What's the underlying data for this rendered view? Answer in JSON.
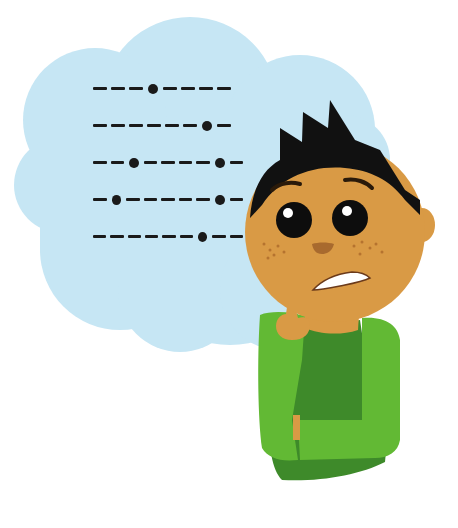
{
  "scene": {
    "description": "Cartoon boy with worried expression thinking of morse code sequences in a thought cloud",
    "colors": {
      "cloud": "#c6e6f4",
      "skin": "#d99a45",
      "hair": "#111111",
      "sweater_light": "#62b934",
      "sweater_dark": "#3e8a2a",
      "morse": "#1a1a1a"
    }
  },
  "thought_cloud": {
    "morse_rows": [
      [
        "dash",
        "dash",
        "dash",
        "dot",
        "dash",
        "dash",
        "dash",
        "dash"
      ],
      [
        "dash",
        "dash",
        "dash",
        "dash",
        "dash",
        "dash",
        "dot",
        "dash"
      ],
      [
        "dash",
        "dash",
        "dot",
        "dash",
        "dash",
        "dash",
        "dash",
        "dot",
        "dash"
      ],
      [
        "dash",
        "dot",
        "dash",
        "dash",
        "dash",
        "dash",
        "dash",
        "dot",
        "dash"
      ],
      [
        "dash",
        "dash",
        "dash",
        "dash",
        "dash",
        "dash",
        "dot",
        "dash",
        "dash"
      ]
    ]
  },
  "character": {
    "expression": "worried",
    "pose": "hand-on-chin-thinking"
  }
}
